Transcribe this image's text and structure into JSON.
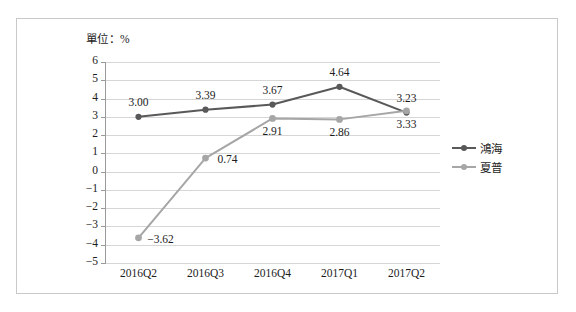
{
  "chart_data": {
    "type": "line",
    "title": "",
    "unit_label": "單位：%",
    "xlabel": "",
    "ylabel": "",
    "categories": [
      "2016Q2",
      "2016Q3",
      "2016Q4",
      "2017Q1",
      "2017Q2"
    ],
    "ylim": [
      -5,
      6
    ],
    "yticks": [
      "6",
      "5",
      "4",
      "3",
      "2",
      "1",
      "0",
      "−1",
      "−2",
      "−3",
      "−4",
      "−5"
    ],
    "ytick_values": [
      6,
      5,
      4,
      3,
      2,
      1,
      0,
      -1,
      -2,
      -3,
      -4,
      -5
    ],
    "grid": true,
    "legend_position": "right",
    "series": [
      {
        "name": "鴻海",
        "color": "#595959",
        "values": [
          3.0,
          3.39,
          3.67,
          4.64,
          3.23
        ],
        "labels": [
          "3.00",
          "3.39",
          "3.67",
          "4.64",
          "3.23"
        ],
        "label_positions": [
          "above",
          "above",
          "above",
          "above",
          "above"
        ]
      },
      {
        "name": "夏普",
        "color": "#a6a6a6",
        "values": [
          -3.62,
          0.74,
          2.91,
          2.86,
          3.33
        ],
        "labels": [
          "−3.62",
          "0.74",
          "2.91",
          "2.86",
          "3.33"
        ],
        "label_positions": [
          "right",
          "right",
          "below",
          "below",
          "below"
        ]
      }
    ]
  },
  "legend": {
    "items": [
      {
        "label": "鴻海",
        "color": "#595959"
      },
      {
        "label": "夏普",
        "color": "#a6a6a6"
      }
    ]
  },
  "frame": {
    "border_color": "#c9c9c9",
    "background": "#ffffff"
  }
}
